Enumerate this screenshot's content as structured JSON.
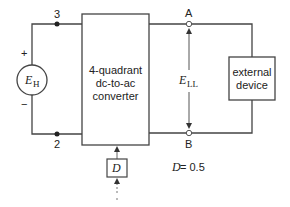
{
  "source": {
    "symbol": "E",
    "subscript": "H",
    "plus_sign": "+",
    "minus_sign": "−"
  },
  "nodes": {
    "top_left": "3",
    "bottom_left": "2",
    "top_right": "A",
    "bottom_right": "B"
  },
  "converter": {
    "line1": "4-quadrant",
    "line2": "dc-to-ac",
    "line3": "converter"
  },
  "load": {
    "line1": "external",
    "line2": "device"
  },
  "voltage": {
    "symbol": "E",
    "subscript": "LL"
  },
  "control": {
    "symbol": "D"
  },
  "annotation": {
    "symbol": "D",
    "equals": " = 0.5"
  },
  "colors": {
    "line": "#444444",
    "text": "#222222",
    "background": "#ffffff"
  }
}
